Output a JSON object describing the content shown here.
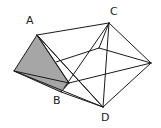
{
  "diagram": {
    "type": "geometric-solid",
    "colors": {
      "edge": "#1a1a1a",
      "shaded_face": "#a6a6a6",
      "background": "#ffffff"
    },
    "vertices": {
      "A": {
        "label": "A",
        "x": 37,
        "y": 35,
        "label_x": 26,
        "label_y": 24
      },
      "B": {
        "label": "B",
        "x": 61,
        "y": 92,
        "label_x": 53,
        "label_y": 104
      },
      "C": {
        "label": "C",
        "x": 109,
        "y": 23,
        "label_x": 110,
        "label_y": 15
      },
      "D": {
        "label": "D",
        "x": 103,
        "y": 107,
        "label_x": 101,
        "label_y": 121
      },
      "L": {
        "label": "",
        "x": 14,
        "y": 71
      },
      "B2": {
        "label": "",
        "x": 69,
        "y": 83
      },
      "P": {
        "label": "",
        "x": 99,
        "y": 48
      },
      "E": {
        "label": "",
        "x": 151,
        "y": 63
      }
    },
    "labels": [
      "A",
      "B",
      "C",
      "D"
    ]
  }
}
